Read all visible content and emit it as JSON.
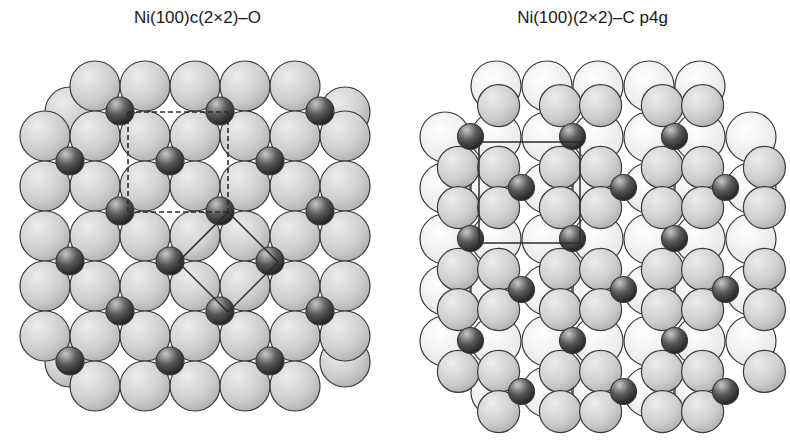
{
  "figure": {
    "left_panel": {
      "title": "Ni(100)c(2×2)–O",
      "surface": "Ni(100)",
      "overlayer": "c(2x2)",
      "adsorbate": "O",
      "unit_cells": [
        "dashed-square-c(2x2)",
        "solid-rotated-square-primitive"
      ]
    },
    "right_panel": {
      "title": "Ni(100)(2×2)–C p4g",
      "surface": "Ni(100)",
      "overlayer": "(2x2) p4g",
      "adsorbate": "C",
      "unit_cells": [
        "solid-square-(2x2)"
      ]
    },
    "colors": {
      "substrate_atom": "#c8c8c8",
      "substrate_outline": "#3a3a3a",
      "adsorbate_atom": "#2a2a2a",
      "second_layer_atom": "#f2f2f2",
      "cell_line": "#2b2b2b"
    }
  }
}
